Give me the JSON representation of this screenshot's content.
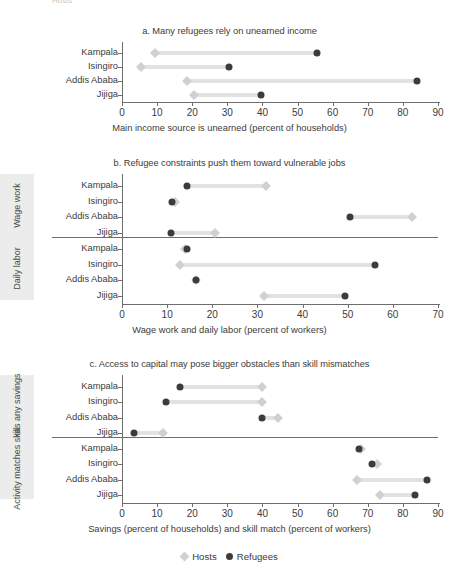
{
  "figure": {
    "clipped_top_text": "Hosts",
    "legend": {
      "position": "bottom-center",
      "entries": [
        {
          "label": "Hosts",
          "marker": "diamond",
          "color": "#d0d0d0"
        },
        {
          "label": "Refugees",
          "marker": "circle",
          "color": "#3c3c3c"
        }
      ]
    },
    "colors": {
      "refugees": "#3c3c3c",
      "hosts": "#d0d0d0",
      "connector": "#e2e2e2",
      "axis": "#6e6e6e",
      "group_band": "#ececec",
      "text": "#3b3b3b"
    }
  },
  "chart_data": [
    {
      "type": "scatter",
      "subtype": "dumbbell",
      "panel": "a",
      "title": "a. Many refugees rely on unearned income",
      "xlabel": "Main income source is unearned (percent of households)",
      "ylabel": "",
      "xlim": [
        0,
        90
      ],
      "xticks": [
        0,
        10,
        20,
        30,
        40,
        50,
        60,
        70,
        80,
        90
      ],
      "grid": false,
      "categories": [
        "Kampala",
        "Isingiro",
        "Addis Ababa",
        "Jijiga"
      ],
      "series": [
        {
          "name": "Hosts",
          "values": [
            9.5,
            5.5,
            18.5,
            20.5
          ]
        },
        {
          "name": "Refugees",
          "values": [
            55.5,
            30.5,
            84.0,
            39.5
          ]
        }
      ]
    },
    {
      "type": "scatter",
      "subtype": "dumbbell",
      "panel": "b",
      "title": "b. Refugee constraints push them toward vulnerable jobs",
      "xlabel": "Wage work and daily labor (percent of workers)",
      "ylabel": "",
      "xlim": [
        0,
        70
      ],
      "xticks": [
        0,
        10,
        20,
        30,
        40,
        50,
        60,
        70
      ],
      "grid": false,
      "groups": [
        {
          "name": "Wage work",
          "categories": [
            "Kampala",
            "Isingiro",
            "Addis Ababa",
            "Jijiga"
          ],
          "series": [
            {
              "name": "Hosts",
              "values": [
                32.0,
                11.8,
                64.3,
                20.5
              ]
            },
            {
              "name": "Refugees",
              "values": [
                14.5,
                11.0,
                50.5,
                10.8
              ]
            }
          ]
        },
        {
          "name": "Daily labor",
          "categories": [
            "Kampala",
            "Isingiro",
            "Addis Ababa",
            "Jijiga"
          ],
          "series": [
            {
              "name": "Hosts",
              "values": [
                14.0,
                12.8,
                16.3,
                31.5
              ]
            },
            {
              "name": "Refugees",
              "values": [
                14.3,
                56.0,
                16.5,
                49.3
              ]
            }
          ]
        }
      ]
    },
    {
      "type": "scatter",
      "subtype": "dumbbell",
      "panel": "c",
      "title": "c. Access to capital may pose bigger obstacles than skill mismatches",
      "xlabel": "Savings (percent of households) and skill match (percent of workers)",
      "ylabel": "",
      "xlim": [
        0,
        90
      ],
      "xticks": [
        0,
        10,
        20,
        30,
        40,
        50,
        60,
        70,
        80,
        90
      ],
      "grid": false,
      "groups": [
        {
          "name": "Has any savings",
          "categories": [
            "Kampala",
            "Isingiro",
            "Addis Ababa",
            "Jijiga"
          ],
          "series": [
            {
              "name": "Hosts",
              "values": [
                40.0,
                40.0,
                44.5,
                11.8
              ]
            },
            {
              "name": "Refugees",
              "values": [
                16.6,
                12.4,
                40.0,
                3.5
              ]
            }
          ]
        },
        {
          "name": "Activity matches skill",
          "categories": [
            "Kampala",
            "Isingiro",
            "Addis Ababa",
            "Jijiga"
          ],
          "series": [
            {
              "name": "Hosts",
              "values": [
                68.0,
                72.5,
                67.0,
                73.5
              ]
            },
            {
              "name": "Refugees",
              "values": [
                67.5,
                71.3,
                87.0,
                83.5
              ]
            }
          ]
        }
      ]
    }
  ]
}
